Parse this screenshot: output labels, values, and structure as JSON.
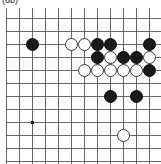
{
  "caption": {
    "text": "(6b)"
  },
  "board": {
    "title": "go-board-diagram",
    "type": "go-board",
    "visible_columns": 12,
    "visible_rows": 12,
    "cell_size_px": 13,
    "origin_px": {
      "x": 19,
      "y": 10
    },
    "edges": {
      "right_border": true,
      "bottom_border": false,
      "left_border": false,
      "top_border": false
    },
    "colors": {
      "line": "#58585a",
      "border": "#3b3b3d",
      "black_stone": "#1a1a1a",
      "white_stone": "#ffffff",
      "white_stone_outline": "#3a3a3a",
      "background": "#ffffff"
    },
    "star_points": [
      {
        "col": 1,
        "row": 2
      },
      {
        "col": 1,
        "row": 8
      }
    ],
    "stones": [
      {
        "color": "black",
        "col": 1,
        "row": 2
      },
      {
        "color": "white",
        "col": 4,
        "row": 2
      },
      {
        "color": "white",
        "col": 5,
        "row": 2
      },
      {
        "color": "black",
        "col": 6,
        "row": 2
      },
      {
        "color": "black",
        "col": 7,
        "row": 2
      },
      {
        "color": "black",
        "col": 10,
        "row": 2
      },
      {
        "color": "black",
        "col": 6,
        "row": 3
      },
      {
        "color": "white",
        "col": 7,
        "row": 3
      },
      {
        "color": "black",
        "col": 8,
        "row": 3
      },
      {
        "color": "black",
        "col": 9,
        "row": 3
      },
      {
        "color": "white",
        "col": 10,
        "row": 3
      },
      {
        "color": "white",
        "col": 5,
        "row": 4
      },
      {
        "color": "white",
        "col": 6,
        "row": 4
      },
      {
        "color": "white",
        "col": 7,
        "row": 4
      },
      {
        "color": "white",
        "col": 8,
        "row": 4
      },
      {
        "color": "white",
        "col": 9,
        "row": 4
      },
      {
        "color": "black",
        "col": 10,
        "row": 4
      },
      {
        "color": "black",
        "col": 7,
        "row": 6
      },
      {
        "color": "black",
        "col": 9,
        "row": 6
      },
      {
        "color": "white",
        "col": 8,
        "row": 9
      }
    ]
  }
}
